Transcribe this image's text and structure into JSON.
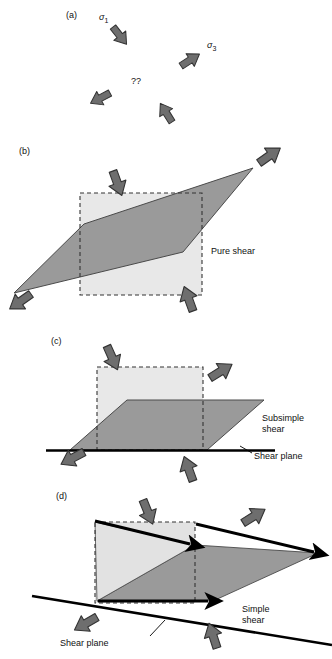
{
  "figure": {
    "type": "schematic-diagram",
    "width": 332,
    "height": 659,
    "background": "#ffffff",
    "colors": {
      "arrow_gray": "#6e6e6e",
      "arrow_outline": "#3a3a3a",
      "dark_fill": "#999999",
      "light_fill": "#e2e2e2",
      "line_black": "#000000",
      "text": "#111111"
    }
  },
  "panels": [
    {
      "id": "a",
      "label": "(a)",
      "label_x": 66,
      "label_y": 16,
      "annotations": [
        {
          "name": "sigma-1-label",
          "text": "σ",
          "sub": "1",
          "x": 100,
          "y": 15
        },
        {
          "name": "sigma-3-label",
          "text": "σ",
          "sub": "3",
          "x": 208,
          "y": 43
        },
        {
          "name": "question-label",
          "text": "??",
          "x": 133,
          "y": 80
        }
      ],
      "arrows": [
        {
          "name": "sigma-1-arrow",
          "direction": "down-right",
          "x": 118,
          "y": 28,
          "angle": 52
        },
        {
          "name": "sigma-3-arrow",
          "direction": "up-right",
          "x": 186,
          "y": 52,
          "angle": -32
        },
        {
          "name": "lower-left-arrow",
          "direction": "down-left",
          "x": 88,
          "y": 96,
          "angle": 208
        },
        {
          "name": "lower-right-arrow",
          "direction": "up-left",
          "x": 152,
          "y": 100,
          "angle": 300
        }
      ]
    },
    {
      "id": "b",
      "label": "(b)",
      "label_x": 19,
      "label_y": 151,
      "caption": "Pure shear",
      "caption_x": 211,
      "caption_y": 251,
      "description": "Coaxial flattening: square (dashed) deforms to a parallelogram elongated along the NE-SW diagonal",
      "arrows": [
        {
          "name": "shortening-arrow-top",
          "direction": "down-right",
          "x": 120,
          "y": 168
        },
        {
          "name": "shortening-arrow-bottom",
          "direction": "up-left",
          "x": 180,
          "y": 283
        },
        {
          "name": "extension-arrow-ne",
          "direction": "up-right",
          "x": 268,
          "y": 152
        },
        {
          "name": "extension-arrow-sw",
          "direction": "down-left",
          "x": 10,
          "y": 281
        }
      ]
    },
    {
      "id": "c",
      "label": "(c)",
      "label_x": 51,
      "label_y": 341,
      "caption_line1": "Subsimple",
      "caption_line2": "shear",
      "caption_x": 262,
      "caption_y": 424,
      "shear_plane_label": "Shear plane",
      "shear_plane_x": 254,
      "shear_plane_y": 456,
      "description": "General non-coaxial flow: combined shortening and simple shear above a horizontal shear plane",
      "arrows": [
        {
          "name": "shortening-arrow-top",
          "direction": "down-right",
          "x": 113,
          "y": 344
        },
        {
          "name": "shortening-arrow-bottom",
          "direction": "up-left",
          "x": 182,
          "y": 452
        },
        {
          "name": "extension-arrow-right",
          "direction": "up-right",
          "x": 215,
          "y": 364
        },
        {
          "name": "extension-arrow-left",
          "direction": "down-left",
          "x": 60,
          "y": 452
        }
      ]
    },
    {
      "id": "d",
      "label": "(d)",
      "label_x": 56,
      "label_y": 496,
      "caption_line1": "Simple",
      "caption_line2": "shear",
      "caption_x": 242,
      "caption_y": 614,
      "shear_plane_label": "Shear plane",
      "shear_plane_x": 60,
      "shear_plane_y": 643,
      "description": "Non-coaxial simple shear along an inclined shear plane; heavy black arrows show particle displacement paths",
      "arrows": [
        {
          "name": "shortening-arrow-top",
          "direction": "down-right",
          "x": 140,
          "y": 502
        },
        {
          "name": "shortening-arrow-bottom",
          "direction": "up-left",
          "x": 203,
          "y": 617
        },
        {
          "name": "extension-arrow-right",
          "direction": "up-right",
          "x": 250,
          "y": 512
        },
        {
          "name": "extension-arrow-left",
          "direction": "down-left",
          "x": 73,
          "y": 618
        },
        {
          "name": "displacement-arrow-short",
          "direction": "right",
          "x": 95,
          "y": 522
        },
        {
          "name": "displacement-arrow-long",
          "direction": "right",
          "x": 185,
          "y": 524
        },
        {
          "name": "displacement-arrow-base",
          "direction": "right",
          "x": 97,
          "y": 598
        }
      ]
    }
  ]
}
